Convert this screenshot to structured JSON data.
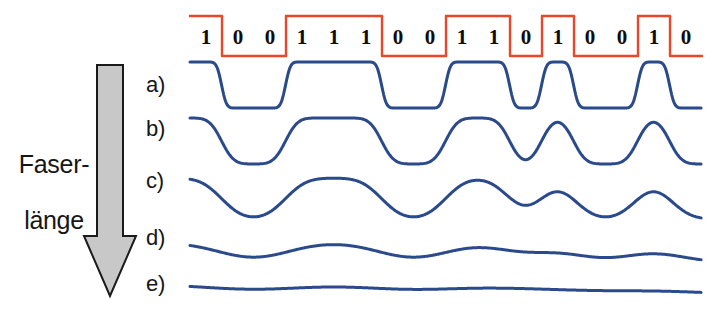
{
  "figure": {
    "axis_label": "Faser-\nlänge",
    "axis_label_line1": "Faser-",
    "axis_label_line2": "länge",
    "arrow_direction": "down",
    "background_color": "#ffffff"
  },
  "colors": {
    "nrz_signal": "#E8472A",
    "trace": "#2B4A8B",
    "arrow_fill": "#C8C8C8",
    "arrow_stroke": "#1A1A1A",
    "text": "#161616",
    "digit": "#0D0D0D"
  },
  "bit_sequence": {
    "bits": [
      1,
      0,
      0,
      1,
      1,
      1,
      0,
      0,
      1,
      1,
      0,
      1,
      0,
      0,
      1,
      0
    ],
    "labels": [
      "1",
      "0",
      "0",
      "1",
      "1",
      "1",
      "0",
      "0",
      "1",
      "1",
      "0",
      "1",
      "0",
      "0",
      "1",
      "0"
    ],
    "count": 16,
    "encoding": "NRZ",
    "string": "1001110011010010"
  },
  "trace_labels": [
    "a)",
    "b)",
    "c)",
    "d)",
    "e)"
  ],
  "chart_data": {
    "type": "line",
    "xlabel": "",
    "ylabel": "Faserlänge",
    "grid": false,
    "legend": "none",
    "x": [
      0,
      1,
      2,
      3,
      4,
      5,
      6,
      7,
      8,
      9,
      10,
      11,
      12,
      13,
      14,
      15
    ],
    "categories": [
      "1",
      "0",
      "0",
      "1",
      "1",
      "1",
      "0",
      "0",
      "1",
      "1",
      "0",
      "1",
      "0",
      "0",
      "1",
      "0"
    ],
    "series": [
      {
        "name": "NRZ input signal",
        "label": "",
        "color": "#E8472A",
        "values": [
          1,
          0,
          0,
          1,
          1,
          1,
          0,
          0,
          1,
          1,
          0,
          1,
          0,
          0,
          1,
          0
        ],
        "baseline_y": 56,
        "high_y": 16,
        "smoothing_sigma": 0.0,
        "amplitude": 1.0
      },
      {
        "name": "a",
        "label": "a)",
        "color": "#2B4A8B",
        "values": [
          1,
          0,
          0,
          1,
          1,
          1,
          0,
          0,
          1,
          1,
          0,
          1,
          0,
          0,
          1,
          0
        ],
        "baseline_y": 108,
        "high_y": 62,
        "smoothing_sigma": 0.12,
        "amplitude": 1.0
      },
      {
        "name": "b",
        "label": "b)",
        "color": "#2B4A8B",
        "values": [
          1,
          0,
          0,
          1,
          1,
          1,
          0,
          0,
          1,
          1,
          0,
          1,
          0,
          0,
          1,
          0
        ],
        "baseline_y": 164,
        "high_y": 118,
        "smoothing_sigma": 0.3,
        "amplitude": 1.0
      },
      {
        "name": "c",
        "label": "c)",
        "color": "#2B4A8B",
        "values": [
          1,
          0,
          0,
          1,
          1,
          1,
          0,
          0,
          1,
          1,
          0,
          1,
          0,
          0,
          1,
          0
        ],
        "baseline_y": 219,
        "high_y": 176,
        "smoothing_sigma": 0.52,
        "amplitude": 0.95
      },
      {
        "name": "d",
        "label": "d)",
        "color": "#2B4A8B",
        "values": [
          1,
          0,
          0,
          1,
          1,
          1,
          0,
          0,
          1,
          1,
          0,
          1,
          0,
          0,
          1,
          0
        ],
        "baseline_y": 262,
        "high_y": 234,
        "smoothing_sigma": 0.88,
        "amplitude": 0.62
      },
      {
        "name": "e",
        "label": "e)",
        "color": "#2B4A8B",
        "values": [
          1,
          0,
          0,
          1,
          1,
          1,
          0,
          0,
          1,
          1,
          0,
          1,
          0,
          0,
          1,
          0
        ],
        "baseline_y": 294,
        "high_y": 276,
        "smoothing_sigma": 1.45,
        "amplitude": 0.42
      }
    ],
    "annotation": "Pulsverbreiterung nimmt mit der Faserlänge zu"
  },
  "geometry": {
    "plot_left": 190,
    "plot_right": 702,
    "bit_width": 32,
    "digit_y": 27,
    "label_x": 146,
    "label_y": [
      74,
      118,
      170,
      227,
      273
    ],
    "arrow": {
      "cx": 110,
      "top": 65,
      "bottom": 296,
      "shaft_half_width": 13,
      "head_half_width": 26,
      "head_top": 236
    }
  }
}
